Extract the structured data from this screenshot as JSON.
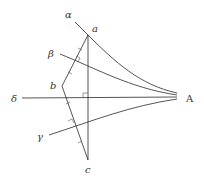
{
  "diagram": {
    "type": "geometric-construction",
    "colors": {
      "stroke": "#2a2a2a",
      "text": "#333333",
      "background": "#ffffff"
    },
    "labels": {
      "alpha": "α",
      "beta": "β",
      "gamma": "γ",
      "delta": "δ",
      "point_a": "a",
      "point_b": "b",
      "point_c": "c",
      "point_A": "A"
    },
    "points": {
      "a": [
        88,
        35
      ],
      "b": [
        62,
        86
      ],
      "c": [
        88,
        160
      ],
      "A": [
        177,
        97
      ]
    },
    "elements": [
      "triangle abc",
      "perpendicular bisector of ab (beta curve to A)",
      "perpendicular bisector of bc (gamma curve to A)",
      "curve alpha through a to A",
      "horizontal line delta to A",
      "right angle mark at intersection of vertical ac and delta"
    ]
  }
}
